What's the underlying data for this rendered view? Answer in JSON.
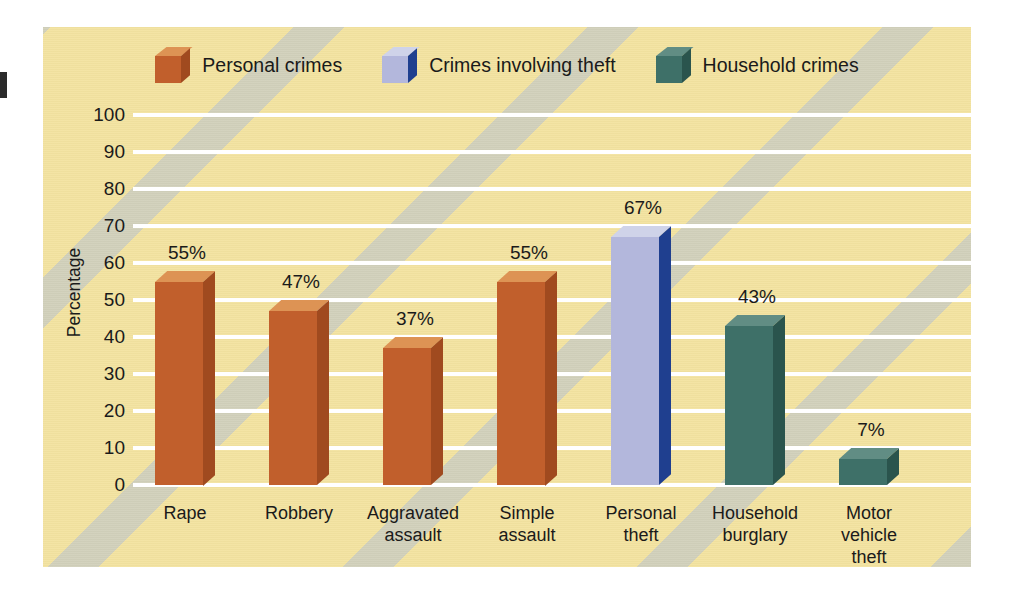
{
  "figure": {
    "background_color": "#f3e3a0",
    "gridline_color": "#ffffff",
    "watermark_color": "#b0bed6"
  },
  "legend": {
    "position": "top-center",
    "items": [
      {
        "label": "Personal crimes",
        "front": "#c15f2c",
        "top": "#dd9354",
        "side": "#a04a1f"
      },
      {
        "label": "Crimes involving theft",
        "front": "#b3b7dc",
        "top": "#cfd3e9",
        "side": "#1f3f8f"
      },
      {
        "label": "Household crimes",
        "front": "#3e7068",
        "top": "#618d84",
        "side": "#2a544d"
      }
    ]
  },
  "chart_data": {
    "type": "bar",
    "title": "",
    "xlabel": "",
    "ylabel": "Percentage",
    "ylim": [
      0,
      100
    ],
    "yticks": [
      100,
      90,
      80,
      70,
      60,
      50,
      40,
      30,
      20,
      10,
      0
    ],
    "grid": true,
    "value_suffix": "%",
    "categories": [
      "Rape",
      "Robbery",
      "Aggravated\nassault",
      "Simple\nassault",
      "Personal\ntheft",
      "Household\nburglary",
      "Motor\nvehicle\ntheft"
    ],
    "category_lines": [
      [
        "Rape"
      ],
      [
        "Robbery"
      ],
      [
        "Aggravated",
        "assault"
      ],
      [
        "Simple",
        "assault"
      ],
      [
        "Personal",
        "theft"
      ],
      [
        "Household",
        "burglary"
      ],
      [
        "Motor",
        "vehicle",
        "theft"
      ]
    ],
    "values": [
      55,
      47,
      37,
      55,
      67,
      43,
      7
    ],
    "value_labels": [
      "55%",
      "47%",
      "37%",
      "55%",
      "67%",
      "43%",
      "7%"
    ],
    "series_assignment": [
      "Personal crimes",
      "Personal crimes",
      "Personal crimes",
      "Personal crimes",
      "Crimes involving theft",
      "Household crimes",
      "Household crimes"
    ]
  }
}
